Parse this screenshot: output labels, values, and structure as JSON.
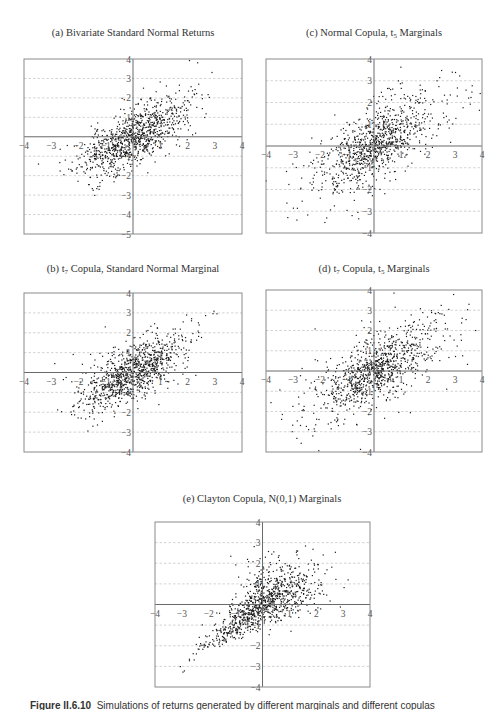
{
  "figure": {
    "caption_label": "Figure II.6.10",
    "caption_text": "Simulations of returns generated by different marginals and different copulas"
  },
  "chart_data": [
    {
      "id": "a",
      "type": "scatter",
      "title": "(a) Bivariate Standard Normal Returns",
      "title_parts": {
        "pre": "(a) Bivariate Standard Normal Returns",
        "sub1": "",
        "mid": "",
        "sub2": "",
        "post": ""
      },
      "frame_px": {
        "left": 24,
        "top": 59,
        "right": 242,
        "bottom": 234
      },
      "xlim": [
        -4,
        4
      ],
      "ylim": [
        -5,
        4
      ],
      "xticks": [
        -4,
        -3,
        -2,
        -1,
        1,
        2,
        3,
        4
      ],
      "yticks": [
        4,
        3,
        2,
        1,
        -1,
        -2,
        -3,
        -4,
        -5
      ],
      "grid_y": [
        3,
        2,
        1,
        -1,
        -2,
        -3,
        -4
      ],
      "grid": "horizontal dashed",
      "copula": "normal",
      "marginal": "normal",
      "correlation": 0.7,
      "n_points": 1000,
      "seed": 11
    },
    {
      "id": "c",
      "type": "scatter",
      "title": "(c) Normal Copula, t5 Marginals",
      "title_parts": {
        "pre": "(c) Normal Copula, t",
        "sub1": "5",
        "mid": " Marginals",
        "sub2": "",
        "post": ""
      },
      "frame_px": {
        "left": 266,
        "top": 59,
        "right": 482,
        "bottom": 233
      },
      "xlim": [
        -4,
        4
      ],
      "ylim": [
        -4,
        4
      ],
      "xticks": [
        -4,
        -3,
        -2,
        -1,
        1,
        2,
        3,
        4
      ],
      "yticks": [
        4,
        3,
        2,
        1,
        -1,
        -2,
        -3,
        -4
      ],
      "grid_y": [
        3,
        2,
        1,
        -1,
        -2,
        -3
      ],
      "grid": "horizontal dashed",
      "copula": "normal",
      "marginal": "t5",
      "correlation": 0.7,
      "n_points": 1000,
      "seed": 23
    },
    {
      "id": "b",
      "type": "scatter",
      "title": "(b) t7 Copula, Standard Normal Marginal",
      "title_parts": {
        "pre": "(b) t",
        "sub1": "7",
        "mid": " Copula, Standard Normal Marginal",
        "sub2": "",
        "post": ""
      },
      "frame_px": {
        "left": 24,
        "top": 293,
        "right": 242,
        "bottom": 452
      },
      "xlim": [
        -4,
        4
      ],
      "ylim": [
        -4,
        4
      ],
      "xticks": [
        -4,
        -3,
        -2,
        -1,
        1,
        2,
        3,
        4
      ],
      "yticks": [
        4,
        3,
        2,
        1,
        -1,
        -2,
        -3,
        -4
      ],
      "grid_y": [
        3,
        2,
        1,
        -1,
        -2,
        -3
      ],
      "grid": "horizontal dashed",
      "copula": "t7",
      "marginal": "normal",
      "correlation": 0.7,
      "n_points": 1000,
      "seed": 37
    },
    {
      "id": "d",
      "type": "scatter",
      "title": "(d) t7 Copula, t5 Marginals",
      "title_parts": {
        "pre": "(d) t",
        "sub1": "7",
        "mid": " Copula, t",
        "sub2": "5",
        "post": " Marginals"
      },
      "frame_px": {
        "left": 266,
        "top": 290,
        "right": 482,
        "bottom": 452
      },
      "xlim": [
        -4,
        4
      ],
      "ylim": [
        -4,
        4
      ],
      "xticks": [
        -4,
        -3,
        -2,
        -1,
        1,
        2,
        3,
        4
      ],
      "yticks": [
        4,
        3,
        2,
        1,
        -1,
        -2,
        -3,
        -4
      ],
      "grid_y": [
        3,
        2,
        1,
        -1,
        -2,
        -3
      ],
      "grid": "horizontal dashed",
      "copula": "t7",
      "marginal": "t5",
      "correlation": 0.7,
      "n_points": 1000,
      "seed": 51
    },
    {
      "id": "e",
      "type": "scatter",
      "title": "(e) Clayton Copula, N(0,1) Marginals",
      "title_parts": {
        "pre": "(e) Clayton Copula, N(0,1) Marginals",
        "sub1": "",
        "mid": "",
        "sub2": "",
        "post": ""
      },
      "frame_px": {
        "left": 155,
        "top": 522,
        "right": 370,
        "bottom": 687
      },
      "xlim": [
        -4,
        4
      ],
      "ylim": [
        -4,
        4
      ],
      "xticks": [
        -4,
        -3,
        -2,
        -1,
        1,
        2,
        3,
        4
      ],
      "yticks": [
        4,
        3,
        2,
        1,
        -1,
        -2,
        -3,
        -4
      ],
      "grid_y": [
        3,
        2,
        1,
        -1,
        -2,
        -3
      ],
      "grid": "horizontal dashed",
      "copula": "clayton",
      "marginal": "normal",
      "correlation": 0.7,
      "n_points": 1000,
      "seed": 77
    }
  ],
  "titles_px": {
    "a": {
      "cx": 133,
      "top": 27
    },
    "c": {
      "cx": 374,
      "top": 27
    },
    "b": {
      "cx": 133,
      "top": 263
    },
    "d": {
      "cx": 374,
      "top": 263
    },
    "e": {
      "cx": 262,
      "top": 493
    }
  },
  "style": {
    "point_color": "#1a1a1a",
    "frame_color": "#8a8a8a",
    "grid_color": "#c8c8c8",
    "axis_color": "#6a6a6a"
  }
}
